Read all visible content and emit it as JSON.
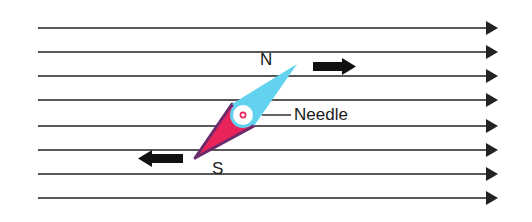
{
  "diagram": {
    "labels": {
      "north": "N",
      "south": "S",
      "needle": "Needle"
    },
    "field_lines": {
      "count": 8,
      "y_positions": [
        28,
        52,
        76,
        100,
        126,
        150,
        174,
        198
      ],
      "x_start": 38,
      "x_end": 498,
      "direction": "right",
      "color": "#222222"
    },
    "needle": {
      "north_tip": [
        297,
        64
      ],
      "center": [
        243,
        114
      ],
      "south_tip": [
        195,
        158
      ],
      "north_color": "#62d2ee",
      "south_color": "#e8245a",
      "outline_color": "#6b2a6b",
      "pivot_color": "#ffffff",
      "pivot_dot_color": "#e8245a"
    },
    "force_arrows": [
      {
        "name": "north-force",
        "direction": "right",
        "x": 313,
        "y": 66
      },
      {
        "name": "south-force",
        "direction": "left",
        "x": 138,
        "y": 158
      }
    ]
  }
}
